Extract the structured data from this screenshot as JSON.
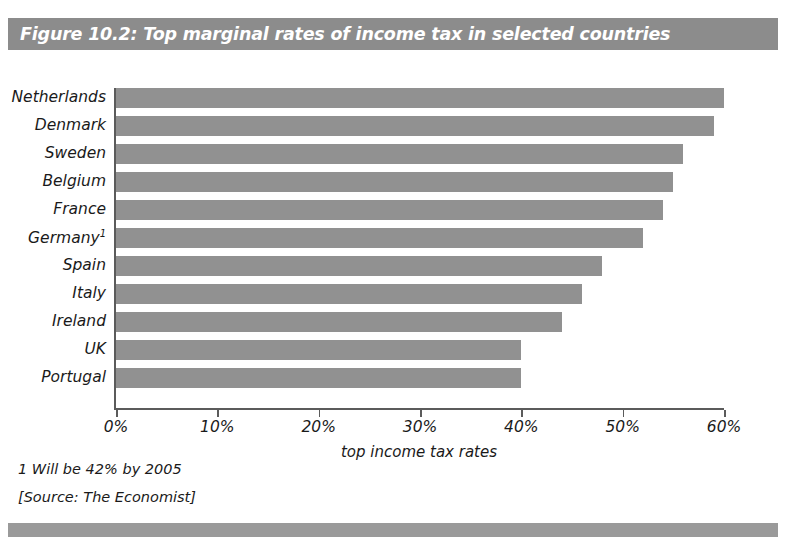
{
  "figure": {
    "title": "Figure 10.2: Top marginal rates of income tax in selected countries",
    "footnote": "1 Will be 42% by 2005",
    "source": "[Source: The Economist]",
    "title_bar_color": "#8c8c8c",
    "footer_bar_color": "#9a9a9a",
    "bar_color": "#919191",
    "axis_color": "#5b5b5b",
    "title_text_color": "#ffffff"
  },
  "chart_data": {
    "type": "bar",
    "orientation": "horizontal",
    "title": "Figure 10.2: Top marginal rates of income tax in selected countries",
    "subtitle": "",
    "xlabel": "top income tax rates",
    "ylabel": "",
    "categories": [
      "Netherlands",
      "Denmark",
      "Sweden",
      "Belgium",
      "France",
      "Germany",
      "Spain",
      "Italy",
      "Ireland",
      "UK",
      "Portugal"
    ],
    "category_labels": [
      "Netherlands",
      "Denmark",
      "Sweden",
      "Belgium",
      "France",
      "Germany¹",
      "Spain",
      "Italy",
      "Ireland",
      "UK",
      "Portugal"
    ],
    "values": [
      60,
      59,
      56,
      55,
      54,
      52,
      48,
      46,
      44,
      40,
      40
    ],
    "value_unit": "%",
    "xlim": [
      0,
      60
    ],
    "xticks": [
      0,
      10,
      20,
      30,
      40,
      50,
      60
    ],
    "xtick_labels": [
      "0%",
      "10%",
      "20%",
      "30%",
      "40%",
      "50%",
      "60%"
    ],
    "grid": false,
    "legend": false,
    "legend_position": "none",
    "annotations": [
      "1 Will be 42% by 2005",
      "[Source: The Economist]"
    ]
  }
}
